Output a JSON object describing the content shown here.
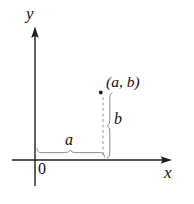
{
  "figure": {
    "labels": {
      "y_axis": "y",
      "x_axis": "x",
      "origin": "0",
      "point": "(a, b)",
      "horizontal_segment": "a",
      "vertical_segment": "b"
    },
    "colors": {
      "axis": "#1f1f1f",
      "measure": "#8e8e8e",
      "dashed": "#9a9a9a",
      "text": "#111111",
      "background": "#ffffff"
    }
  }
}
